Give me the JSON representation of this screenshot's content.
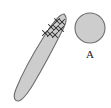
{
  "figure": {
    "background_color": "#ffffff",
    "shape_fill": "#cdcdcd",
    "shape_stroke": "#6e6e6e",
    "mark_color": "#2b2b2b",
    "label_color": "#1a1a1a"
  },
  "elongated_shape": {
    "name": "elongated-blade-shape",
    "description": "narrow elongated pointed shape oriented diagonally from lower-left to upper-right",
    "fill": "#cdcdcd",
    "stroke": "#6e6e6e",
    "tip_top": [
      64,
      14
    ],
    "tip_bottom": [
      16,
      100
    ],
    "path": "M 64 14 C 68 18 66 24 61 33 C 54 47 44 66 34 83 C 28 93 22 101 18 101 C 14 101 13 96 16 89 C 22 74 33 54 43 38 C 52 24 59 14 64 14 Z"
  },
  "cross_marks": {
    "name": "cross-marks",
    "glyph": "×",
    "count": 8,
    "points": [
      [
        57,
        21
      ],
      [
        62,
        22
      ],
      [
        51,
        27
      ],
      [
        56,
        28
      ],
      [
        61,
        29
      ],
      [
        45,
        33
      ],
      [
        50,
        34
      ],
      [
        55,
        35
      ]
    ]
  },
  "circle": {
    "name": "circle-shape-A",
    "fill": "#cdcdcd",
    "stroke": "#6e6e6e",
    "center_x": 90,
    "center_y": 28,
    "radius": 15
  },
  "labels": [
    {
      "id": "label-A",
      "text": "A",
      "x": 90,
      "y": 58
    }
  ]
}
